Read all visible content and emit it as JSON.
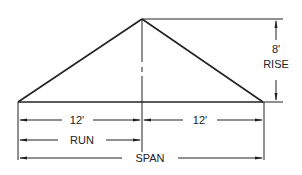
{
  "diagram": {
    "labels": {
      "rise_value": "8'",
      "rise": "RISE",
      "run_left_value": "12'",
      "run_right_value": "12'",
      "run": "RUN",
      "span": "SPAN"
    },
    "colors": {
      "line": "#222222",
      "background": "#ffffff"
    }
  }
}
